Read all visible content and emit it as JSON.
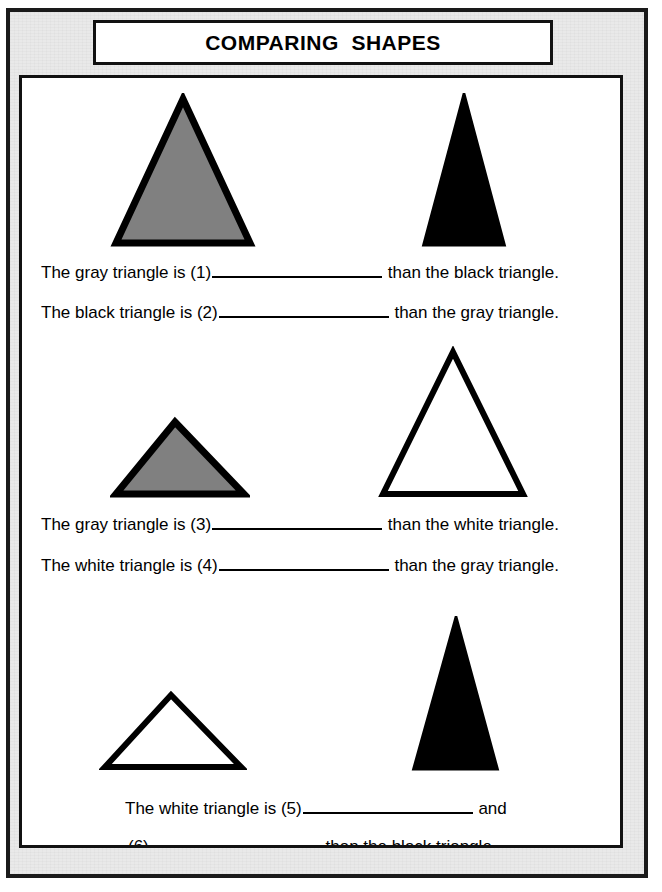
{
  "worksheet": {
    "title": "COMPARING  SHAPES",
    "sentences": [
      {
        "id": "sentence-1",
        "prefix": "The gray triangle is (1)",
        "suffix": " than the black triangle."
      },
      {
        "id": "sentence-2",
        "prefix": "The black triangle is (2)",
        "suffix": " than the gray triangle."
      },
      {
        "id": "sentence-3",
        "prefix": "The gray triangle is (3)",
        "suffix": " than the white triangle."
      },
      {
        "id": "sentence-4",
        "prefix": "The white triangle is (4)",
        "suffix": " than the gray triangle."
      },
      {
        "id": "sentence-5",
        "prefix": "The white triangle is (5)",
        "suffix": " and"
      },
      {
        "id": "sentence-6",
        "prefix": "(6)",
        "suffix": " than the black triangle."
      }
    ],
    "shapes": [
      {
        "name": "gray-triangle-large",
        "fill": "#808080",
        "stroke": "#000000",
        "row": 1,
        "position": "left",
        "description": "large gray triangle"
      },
      {
        "name": "black-triangle-narrow-tall",
        "fill": "#000000",
        "stroke": "#000000",
        "row": 1,
        "position": "right",
        "description": "narrow tall black triangle"
      },
      {
        "name": "gray-triangle-wide-short",
        "fill": "#808080",
        "stroke": "#000000",
        "row": 2,
        "position": "left",
        "description": "wide short gray triangle"
      },
      {
        "name": "white-triangle-large",
        "fill": "#ffffff",
        "stroke": "#000000",
        "row": 2,
        "position": "right",
        "description": "large white outlined triangle"
      },
      {
        "name": "white-triangle-wide-short",
        "fill": "#ffffff",
        "stroke": "#000000",
        "row": 3,
        "position": "left",
        "description": "wide short white outlined triangle"
      },
      {
        "name": "black-triangle-tall",
        "fill": "#000000",
        "stroke": "#000000",
        "row": 3,
        "position": "right",
        "description": "tall black triangle"
      }
    ],
    "colors": {
      "gray_fill": "#808080",
      "black_fill": "#000000",
      "white_fill": "#ffffff",
      "border": "#111111",
      "page_margin": "#e9e9e9"
    }
  }
}
